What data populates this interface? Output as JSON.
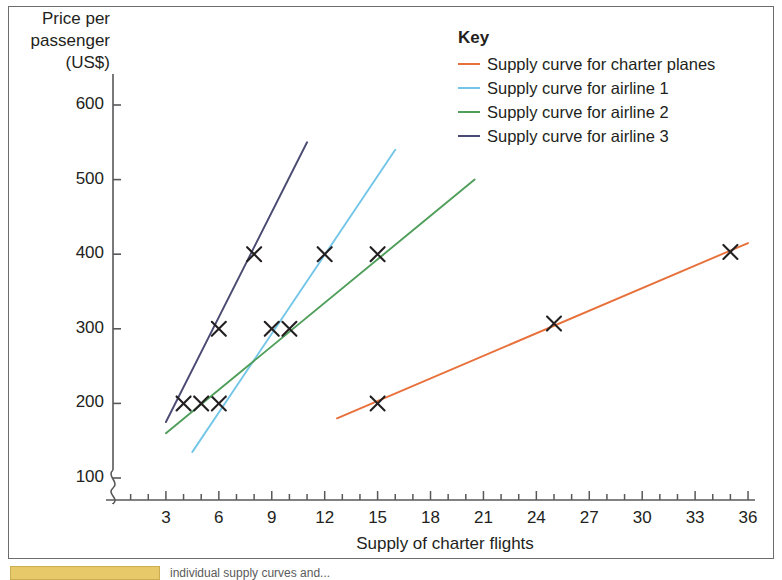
{
  "chart_data": {
    "type": "line",
    "title": "",
    "xlabel": "Supply of charter flights",
    "ylabel": "Price per passenger (US$)",
    "ylabel_lines": [
      "Price per",
      "passenger",
      "(US$)"
    ],
    "xlim": [
      0,
      36
    ],
    "ylim": [
      100,
      620
    ],
    "y_axis_break": true,
    "grid": false,
    "legend_position": "top-right",
    "legend_title": "Key",
    "xticks": [
      3,
      6,
      9,
      12,
      15,
      18,
      21,
      24,
      27,
      30,
      33,
      36
    ],
    "xtick_labels": [
      "3",
      "6",
      "9",
      "12",
      "15",
      "18",
      "21",
      "24",
      "27",
      "30",
      "33",
      "36"
    ],
    "x_minor_step": 1,
    "yticks": [
      100,
      200,
      300,
      400,
      500,
      600
    ],
    "ytick_labels": [
      "100",
      "200",
      "300",
      "400",
      "500",
      "600"
    ],
    "marker": "x",
    "marker_color": "#231f20",
    "series": [
      {
        "name": "Supply curve for charter planes",
        "color": "#e8703a",
        "line": [
          [
            12.7,
            180
          ],
          [
            36.0,
            415
          ]
        ],
        "points": [
          [
            15,
            200
          ],
          [
            25,
            307
          ],
          [
            35,
            403
          ]
        ]
      },
      {
        "name": "Supply curve for airline 1",
        "color": "#73c6e8",
        "line": [
          [
            4.5,
            135
          ],
          [
            16.0,
            540
          ]
        ],
        "points": [
          [
            6,
            200
          ],
          [
            9,
            300
          ],
          [
            12,
            400
          ]
        ]
      },
      {
        "name": "Supply curve for airline 2",
        "color": "#4f9e5a",
        "line": [
          [
            3.0,
            160
          ],
          [
            20.5,
            500
          ]
        ],
        "points": [
          [
            5,
            200
          ],
          [
            10,
            300
          ],
          [
            15,
            400
          ]
        ]
      },
      {
        "name": "Supply curve for airline 3",
        "color": "#4a4a72",
        "line": [
          [
            3.0,
            175
          ],
          [
            11.0,
            550
          ]
        ],
        "points": [
          [
            4,
            200
          ],
          [
            6,
            300
          ],
          [
            8,
            400
          ]
        ]
      }
    ]
  },
  "page": {
    "bottom_caption": "individual supply curves and..."
  }
}
